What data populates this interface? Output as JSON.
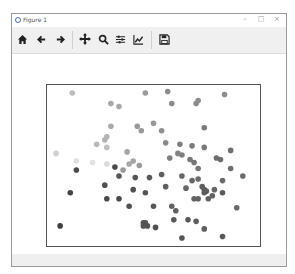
{
  "window": {
    "title": "Figure 1",
    "controls": [
      "minimize",
      "maximize",
      "close"
    ]
  },
  "toolbar": {
    "buttons": [
      {
        "name": "home",
        "icon": "home-icon"
      },
      {
        "name": "back",
        "icon": "arrow-left-icon"
      },
      {
        "name": "forward",
        "icon": "arrow-right-icon"
      },
      {
        "name": "pan",
        "icon": "move-icon"
      },
      {
        "name": "zoom",
        "icon": "magnifier-icon"
      },
      {
        "name": "configure-subplots",
        "icon": "sliders-icon"
      },
      {
        "name": "edit-axes",
        "icon": "line-chart-icon"
      },
      {
        "name": "save",
        "icon": "floppy-disk-icon"
      }
    ]
  },
  "chart_data": {
    "type": "scatter",
    "title": "",
    "xlabel": "",
    "ylabel": "",
    "axis_ticks": "hidden",
    "grid": false,
    "legend": "none",
    "colormap": "grayscale (color varies by point, light to dark)",
    "xlim": [
      0,
      100
    ],
    "ylim": [
      0,
      100
    ],
    "points": [
      {
        "x": 10,
        "y": 98,
        "c": "#bdbdbd"
      },
      {
        "x": 29,
        "y": 91,
        "c": "#a8a8a8"
      },
      {
        "x": 33,
        "y": 89,
        "c": "#a8a8a8"
      },
      {
        "x": 46,
        "y": 98,
        "c": "#9a9a9a"
      },
      {
        "x": 57,
        "y": 99,
        "c": "#8c8c8c"
      },
      {
        "x": 59,
        "y": 91,
        "c": "#8c8c8c"
      },
      {
        "x": 71,
        "y": 91,
        "c": "#8c8c8c"
      },
      {
        "x": 72,
        "y": 93,
        "c": "#8c8c8c"
      },
      {
        "x": 85,
        "y": 97,
        "c": "#8c8c8c"
      },
      {
        "x": 29,
        "y": 76,
        "c": "#ababab"
      },
      {
        "x": 42,
        "y": 76,
        "c": "#9a9a9a"
      },
      {
        "x": 50,
        "y": 78,
        "c": "#999999"
      },
      {
        "x": 44,
        "y": 73,
        "c": "#999999"
      },
      {
        "x": 26,
        "y": 67,
        "c": "#b3b3b3"
      },
      {
        "x": 27,
        "y": 69,
        "c": "#b3b3b3"
      },
      {
        "x": 22,
        "y": 64,
        "c": "#b8b8b8"
      },
      {
        "x": 27,
        "y": 62,
        "c": "#c0c0c0"
      },
      {
        "x": 2,
        "y": 58,
        "c": "#d0d0d0"
      },
      {
        "x": 37,
        "y": 59,
        "c": "#a5a5a5"
      },
      {
        "x": 40,
        "y": 53,
        "c": "#a5a5a5"
      },
      {
        "x": 38,
        "y": 51,
        "c": "#a8a8a8"
      },
      {
        "x": 43,
        "y": 50,
        "c": "#9a9a9a"
      },
      {
        "x": 35,
        "y": 47,
        "c": "#9a9a9a"
      },
      {
        "x": 54,
        "y": 73,
        "c": "#8f8f8f"
      },
      {
        "x": 56,
        "y": 65,
        "c": "#8a8a8a"
      },
      {
        "x": 63,
        "y": 64,
        "c": "#7f7f7f"
      },
      {
        "x": 62,
        "y": 58,
        "c": "#838383"
      },
      {
        "x": 75,
        "y": 75,
        "c": "#7a7a7a"
      },
      {
        "x": 75,
        "y": 62,
        "c": "#7a7a7a"
      },
      {
        "x": 88,
        "y": 60,
        "c": "#6f6f6f"
      },
      {
        "x": 69,
        "y": 63,
        "c": "#7a7a7a"
      },
      {
        "x": 58,
        "y": 55,
        "c": "#808080"
      },
      {
        "x": 64,
        "y": 57,
        "c": "#808080"
      },
      {
        "x": 68,
        "y": 54,
        "c": "#7a7a7a"
      },
      {
        "x": 70,
        "y": 52,
        "c": "#767676"
      },
      {
        "x": 72,
        "y": 48,
        "c": "#767676"
      },
      {
        "x": 81,
        "y": 55,
        "c": "#6e6e6e"
      },
      {
        "x": 83,
        "y": 54,
        "c": "#6e6e6e"
      },
      {
        "x": 88,
        "y": 48,
        "c": "#6e6e6e"
      },
      {
        "x": 94,
        "y": 43,
        "c": "#6a6a6a"
      },
      {
        "x": 84,
        "y": 40,
        "c": "#6a6a6a"
      },
      {
        "x": 12,
        "y": 53,
        "c": "#e0e0e0"
      },
      {
        "x": 20,
        "y": 52,
        "c": "#e3e3e3"
      },
      {
        "x": 27,
        "y": 51,
        "c": "#dcdcdc"
      },
      {
        "x": 31,
        "y": 49,
        "c": "#4a4a4a"
      },
      {
        "x": 12,
        "y": 47,
        "c": "#4a4a4a"
      },
      {
        "x": 33,
        "y": 43,
        "c": "#555555"
      },
      {
        "x": 41,
        "y": 42,
        "c": "#555555"
      },
      {
        "x": 48,
        "y": 42,
        "c": "#5a5a5a"
      },
      {
        "x": 54,
        "y": 44,
        "c": "#5f5f5f"
      },
      {
        "x": 26,
        "y": 37,
        "c": "#505050"
      },
      {
        "x": 9,
        "y": 32,
        "c": "#454545"
      },
      {
        "x": 40,
        "y": 34,
        "c": "#505050"
      },
      {
        "x": 46,
        "y": 32,
        "c": "#555555"
      },
      {
        "x": 56,
        "y": 36,
        "c": "#5f5f5f"
      },
      {
        "x": 27,
        "y": 28,
        "c": "#4a4a4a"
      },
      {
        "x": 33,
        "y": 28,
        "c": "#4a4a4a"
      },
      {
        "x": 38,
        "y": 23,
        "c": "#505050"
      },
      {
        "x": 50,
        "y": 23,
        "c": "#555555"
      },
      {
        "x": 64,
        "y": 43,
        "c": "#656565"
      },
      {
        "x": 69,
        "y": 40,
        "c": "#656565"
      },
      {
        "x": 72,
        "y": 41,
        "c": "#6a6a6a"
      },
      {
        "x": 66,
        "y": 35,
        "c": "#666666"
      },
      {
        "x": 74,
        "y": 36,
        "c": "#5d5d5d"
      },
      {
        "x": 75,
        "y": 34,
        "c": "#5d5d5d"
      },
      {
        "x": 76,
        "y": 33,
        "c": "#5d5d5d"
      },
      {
        "x": 75,
        "y": 32,
        "c": "#5d5d5d"
      },
      {
        "x": 80,
        "y": 34,
        "c": "#686868"
      },
      {
        "x": 70,
        "y": 28,
        "c": "#626262"
      },
      {
        "x": 72,
        "y": 28,
        "c": "#626262"
      },
      {
        "x": 77,
        "y": 28,
        "c": "#626262"
      },
      {
        "x": 79,
        "y": 30,
        "c": "#626262"
      },
      {
        "x": 84,
        "y": 32,
        "c": "#5b5b5b"
      },
      {
        "x": 91,
        "y": 22,
        "c": "#6a6a6a"
      },
      {
        "x": 59,
        "y": 23,
        "c": "#626262"
      },
      {
        "x": 61,
        "y": 20,
        "c": "#626262"
      },
      {
        "x": 60,
        "y": 14,
        "c": "#5a5a5a"
      },
      {
        "x": 46,
        "y": 12,
        "c": "#555555"
      },
      {
        "x": 45,
        "y": 10,
        "c": "#555555"
      },
      {
        "x": 47,
        "y": 10,
        "c": "#555555"
      },
      {
        "x": 45,
        "y": 12,
        "c": "#555555"
      },
      {
        "x": 67,
        "y": 14,
        "c": "#5a5a5a"
      },
      {
        "x": 71,
        "y": 13,
        "c": "#5f5f5f"
      },
      {
        "x": 75,
        "y": 8,
        "c": "#5f5f5f"
      },
      {
        "x": 51,
        "y": 9,
        "c": "#4f4f4f"
      },
      {
        "x": 4,
        "y": 10,
        "c": "#3f3f3f"
      },
      {
        "x": 64,
        "y": 2,
        "c": "#555555"
      },
      {
        "x": 84,
        "y": 3,
        "c": "#5a5a5a"
      }
    ]
  }
}
